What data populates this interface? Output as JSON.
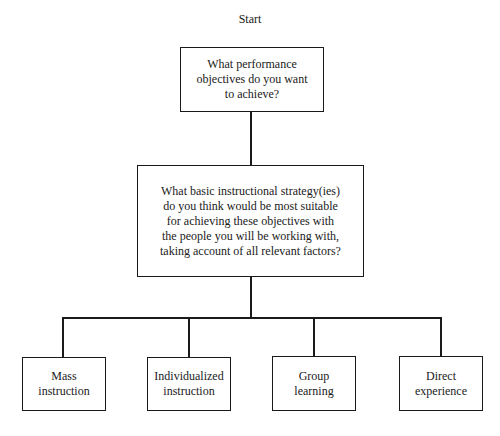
{
  "diagram": {
    "type": "flowchart-tree",
    "start_label": "Start",
    "root": {
      "text": "What performance\nobjectives do you want\nto achieve?"
    },
    "decision": {
      "text": "What basic instructional strategy(ies)\ndo you think would be most suitable\nfor achieving these objectives with\nthe people you will be working with,\ntaking account of all relevant factors?"
    },
    "options": [
      {
        "text": "Mass\ninstruction"
      },
      {
        "text": "Individualized\ninstruction"
      },
      {
        "text": "Group\nlearning"
      },
      {
        "text": "Direct\nexperience"
      }
    ],
    "edges": [
      {
        "from": "start",
        "to": "root"
      },
      {
        "from": "root",
        "to": "decision"
      },
      {
        "from": "decision",
        "to": "options.0"
      },
      {
        "from": "decision",
        "to": "options.1"
      },
      {
        "from": "decision",
        "to": "options.2"
      },
      {
        "from": "decision",
        "to": "options.3"
      }
    ],
    "colors": {
      "line": "#1a1a1a",
      "background": "#ffffff"
    }
  }
}
